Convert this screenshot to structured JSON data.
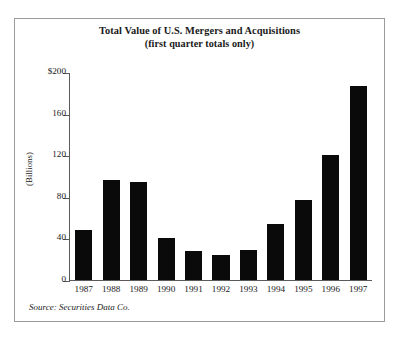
{
  "figure": {
    "title": "Total Value of U.S. Mergers and Acquisitions",
    "subtitle": "(first quarter totals only)",
    "ylabel": "(Billions)",
    "source": "Source: Securities Data Co.",
    "border_color": "#9a9a9a",
    "bar_color": "#0a0a0a",
    "axis_color": "#5a5a5a",
    "background": "#ffffff"
  },
  "chart_data": {
    "type": "bar",
    "title": "Total Value of U.S. Mergers and Acquisitions",
    "subtitle": "(first quarter totals only)",
    "xlabel": "",
    "ylabel": "(Billions)",
    "categories": [
      "1987",
      "1988",
      "1989",
      "1990",
      "1991",
      "1992",
      "1993",
      "1994",
      "1995",
      "1996",
      "1997"
    ],
    "values": [
      48,
      96,
      94,
      40,
      28,
      24,
      29,
      54,
      77,
      120,
      187
    ],
    "ylim": [
      0,
      200
    ],
    "yticks": [
      0,
      40,
      80,
      120,
      160,
      200
    ],
    "ytick_labels": [
      "0",
      "40",
      "80",
      "120",
      "160",
      "$200"
    ],
    "grid": false,
    "legend": "none",
    "units": "Billions of U.S. dollars",
    "source": "Source: Securities Data Co."
  }
}
